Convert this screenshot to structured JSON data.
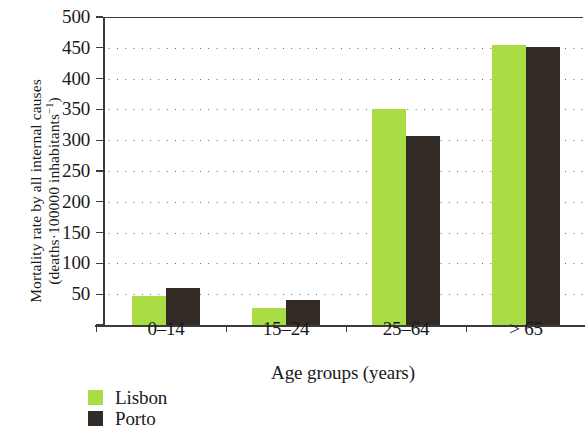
{
  "chart_data": {
    "type": "bar",
    "title": "",
    "categories": [
      "0–14",
      "15–24",
      "25–64",
      "> 65"
    ],
    "series": [
      {
        "name": "Lisbon",
        "color": "#aadd44",
        "values": [
          47,
          28,
          350,
          455
        ]
      },
      {
        "name": "Porto",
        "color": "#332b26",
        "values": [
          60,
          40,
          307,
          452
        ]
      }
    ],
    "xlabel": "Age groups (years)",
    "ylabel_line1": "Mortality rate by all internal causes",
    "ylabel_line2_prefix": "(deaths·100000 inhabitants",
    "ylabel_line2_sup": "−1",
    "ylabel_line2_suffix": ")",
    "ylim": [
      0,
      500
    ],
    "yticks": [
      0,
      50,
      100,
      150,
      200,
      250,
      300,
      350,
      400,
      450,
      500
    ],
    "ytick_labels": [
      "",
      "50",
      "100",
      "150",
      "200",
      "250",
      "300",
      "350",
      "400",
      "450",
      "500"
    ],
    "grid": "horizontal-dotted",
    "legend_position": "bottom-left"
  },
  "legend": {
    "items": [
      {
        "label": "Lisbon",
        "color": "#aadd44"
      },
      {
        "label": "Porto",
        "color": "#332b26"
      }
    ]
  },
  "colors": {
    "lisbon": "#aadd44",
    "porto": "#332b26",
    "axis": "#3b3b3b",
    "grid_dot": "#606060",
    "text": "#1a1a1a",
    "background": "#ffffff"
  }
}
